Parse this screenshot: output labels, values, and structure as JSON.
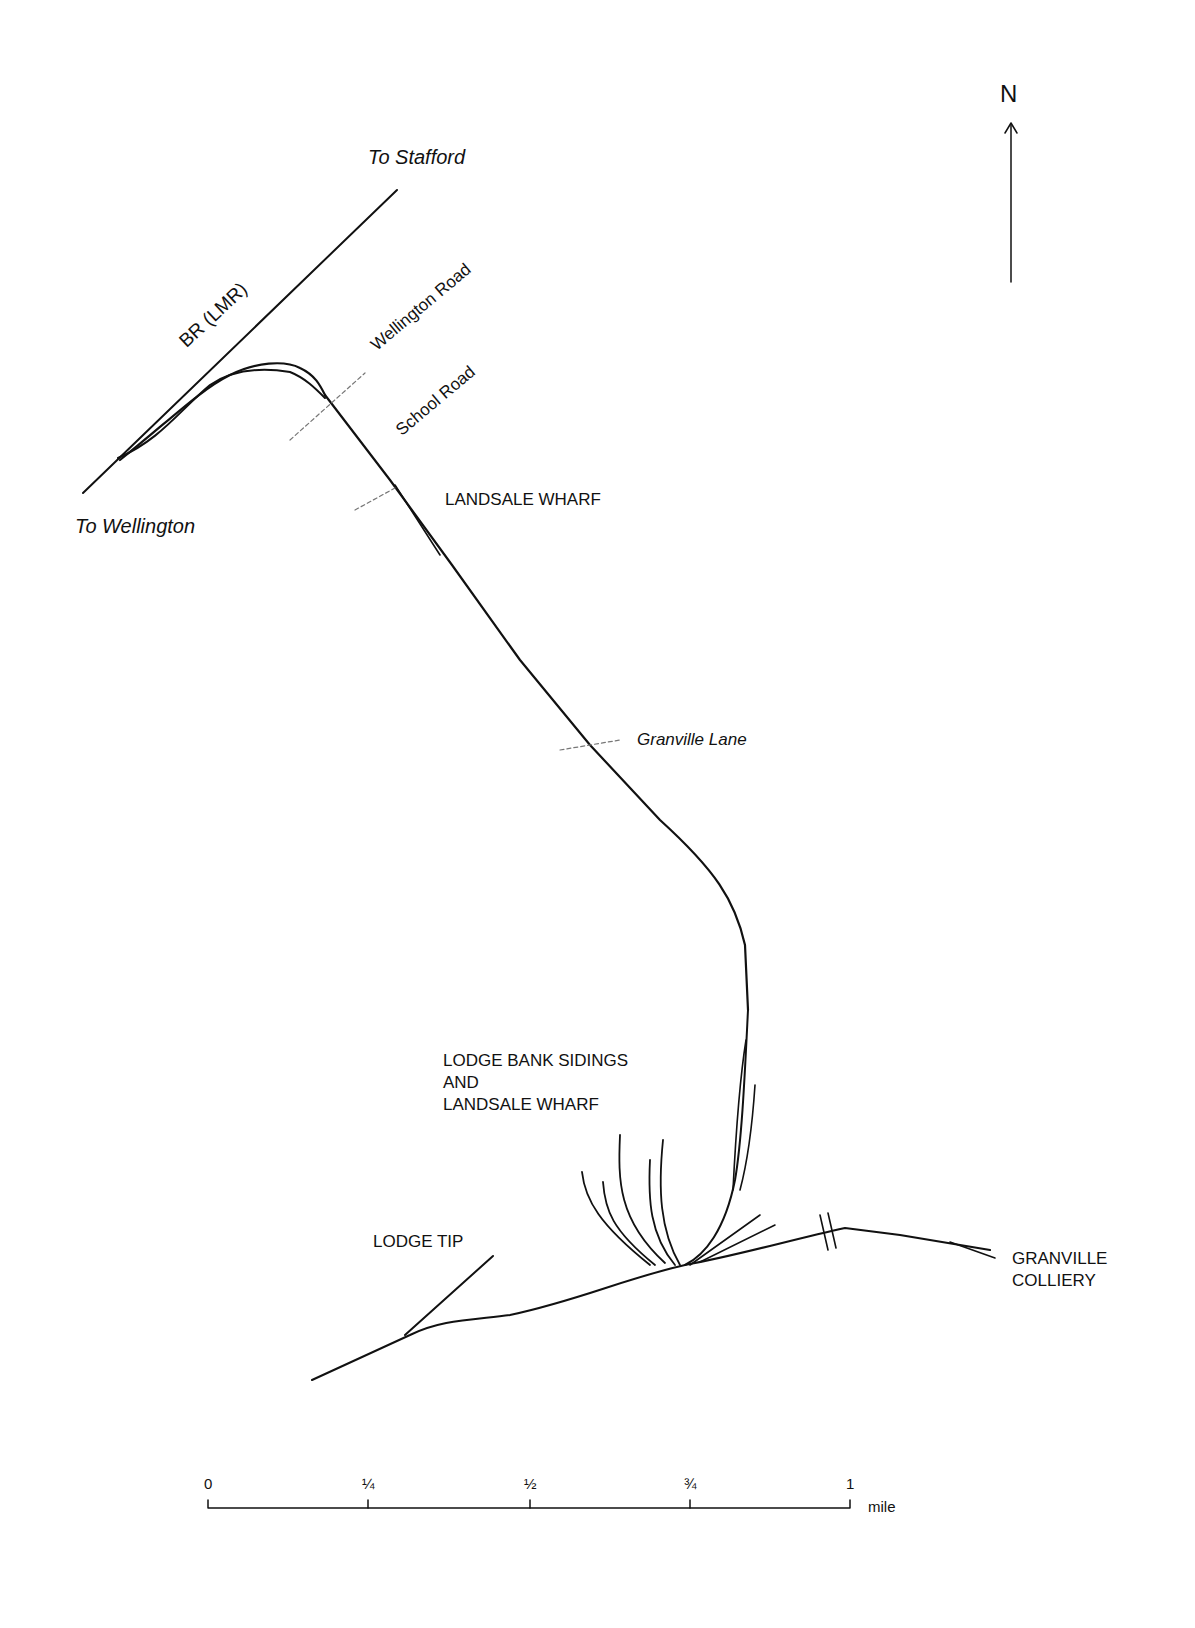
{
  "map": {
    "north_label": "N",
    "labels": {
      "to_stafford": "To Stafford",
      "to_wellington": "To Wellington",
      "br_lmr": "BR  (LMR)",
      "wellington_road": "Wellington Road",
      "school_road": "School Road",
      "landsale_wharf": "LANDSALE WHARF",
      "granville_lane": "Granville Lane",
      "lodge_bank_line1": "LODGE BANK SIDINGS",
      "lodge_bank_line2": "AND",
      "lodge_bank_line3": "LANDSALE WHARF",
      "lodge_tip": "LODGE TIP",
      "granville_line1": "GRANVILLE",
      "granville_line2": "COLLIERY"
    },
    "scale": {
      "ticks": [
        "0",
        "¼",
        "½",
        "¾",
        "1"
      ],
      "unit": "mile"
    },
    "colors": {
      "ink": "#111111",
      "background": "#ffffff"
    }
  }
}
